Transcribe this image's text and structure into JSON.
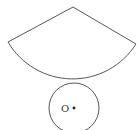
{
  "diagram": {
    "type": "geometry",
    "stroke_color": "#555555",
    "sector": {
      "apex": [
        73,
        7
      ],
      "left_end": [
        8,
        42
      ],
      "right_end": [
        136,
        44
      ],
      "radius": 75
    },
    "circle": {
      "center": [
        74,
        108
      ],
      "radius": 25,
      "center_label": "O"
    }
  }
}
